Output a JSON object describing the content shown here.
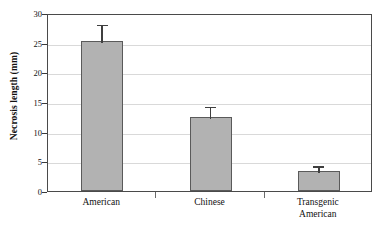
{
  "chart_data": {
    "type": "bar",
    "title": "",
    "subtitle": "",
    "xlabel": "",
    "ylabel": "Necrosis length (mm)",
    "categories": [
      "American",
      "Chinese",
      "Transgenic\nAmerican"
    ],
    "values": [
      25.2,
      12.4,
      3.4
    ],
    "errors_upper": [
      3.1,
      2.1,
      1.1
    ],
    "ylim": [
      0,
      30
    ],
    "ytick_values": [
      0,
      5,
      10,
      15,
      20,
      25,
      30
    ],
    "ytick_labels": [
      "0",
      "5",
      "10",
      "15",
      "20",
      "25",
      "30"
    ],
    "grid": "horizontal",
    "legend": "none",
    "series": [
      {
        "name": "Necrosis length",
        "values": [
          25.2,
          12.4,
          3.4
        ],
        "errors_upper": [
          3.1,
          2.1,
          1.1
        ]
      }
    ],
    "colors": {
      "bar_fill": "#b2b2b2",
      "bar_border": "#5a5a5a",
      "error_bar": "#3f3f3f",
      "gridline": "#d9d9d9",
      "frame": "#4a4a4a",
      "background": "#ffffff",
      "text": "#111111"
    }
  },
  "axis": {
    "y_title": "Necrosis length (mm)"
  }
}
